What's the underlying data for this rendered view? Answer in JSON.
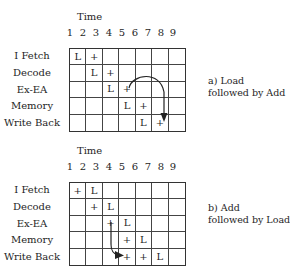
{
  "diagrams": [
    {
      "id": "a",
      "time_label": "Time",
      "time_ticks": [
        "1",
        "2",
        "3",
        "4",
        "5",
        "6",
        "7",
        "8",
        "9"
      ],
      "stages": [
        "I Fetch",
        "Decode",
        "Ex-EA",
        "Memory",
        "Write Back"
      ],
      "grid": [
        [
          "L",
          "+",
          "",
          "",
          "",
          "",
          ""
        ],
        [
          "",
          "L",
          "+",
          "",
          "",
          "",
          ""
        ],
        [
          "",
          "",
          "L",
          "+",
          "",
          "",
          ""
        ],
        [
          "",
          "",
          "",
          "L",
          "+",
          "",
          ""
        ],
        [
          "",
          "",
          "",
          "",
          "L",
          "+",
          ""
        ]
      ],
      "caption_line1": "a) Load",
      "caption_line2": "followed by Add",
      "arrow": "from Ex-EA '+' (col 4) curving to Write Back '+' (col 6)"
    },
    {
      "id": "b",
      "time_label": "Time",
      "time_ticks": [
        "1",
        "2",
        "3",
        "4",
        "5",
        "6",
        "7",
        "8",
        "9"
      ],
      "stages": [
        "I Fetch",
        "Decode",
        "Ex-EA",
        "Memory",
        "Write Back"
      ],
      "grid": [
        [
          "+",
          "L",
          "",
          "",
          "",
          "",
          ""
        ],
        [
          "",
          "+",
          "L",
          "",
          "",
          "",
          ""
        ],
        [
          "",
          "",
          "+",
          "L",
          "",
          "",
          ""
        ],
        [
          "",
          "",
          "",
          "+",
          "L",
          "",
          ""
        ],
        [
          "",
          "",
          "",
          "+",
          "+",
          "L",
          ""
        ]
      ],
      "caption_line1": "b) Add",
      "caption_line2": "followed by Load",
      "arrow": "from Ex-EA '+' (col 3) down to Write Back '+' (col 4)"
    }
  ],
  "colors": {
    "line": "#333333",
    "text": "#1e1e1e",
    "background": "#ffffff"
  }
}
